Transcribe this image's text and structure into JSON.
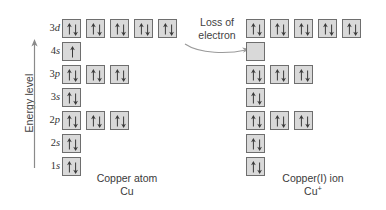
{
  "diagram": {
    "axis": {
      "label": "Energy level",
      "arrow_direction": "up"
    },
    "annotation": {
      "line1": "Loss of",
      "line2": "electron",
      "arrow": "curved-right-arrow"
    },
    "colors": {
      "box_fill": "#d9d9d9",
      "box_border": "#6e6e6e",
      "arrow": "#3a3a3a",
      "text": "#3a3a3a",
      "background": "#ffffff"
    },
    "orbital_labels": [
      {
        "n": "3",
        "l": "d"
      },
      {
        "n": "4",
        "l": "s"
      },
      {
        "n": "3",
        "l": "p"
      },
      {
        "n": "3",
        "l": "s"
      },
      {
        "n": "2",
        "l": "p"
      },
      {
        "n": "2",
        "l": "s"
      },
      {
        "n": "1",
        "l": "s"
      }
    ],
    "left": {
      "caption_line1": "Copper atom",
      "caption_line2": "Cu",
      "caption_sup": "",
      "rows": [
        {
          "label": "3d",
          "boxes": [
            "pair",
            "pair",
            "pair",
            "pair",
            "pair"
          ]
        },
        {
          "label": "4s",
          "boxes": [
            "up"
          ]
        },
        {
          "label": "3p",
          "boxes": [
            "pair",
            "pair",
            "pair"
          ]
        },
        {
          "label": "3s",
          "boxes": [
            "pair"
          ]
        },
        {
          "label": "2p",
          "boxes": [
            "pair",
            "pair",
            "pair"
          ]
        },
        {
          "label": "2s",
          "boxes": [
            "pair"
          ]
        },
        {
          "label": "1s",
          "boxes": [
            "pair"
          ]
        }
      ]
    },
    "right": {
      "caption_line1": "Copper(I) ion",
      "caption_line2": "Cu",
      "caption_sup": "+",
      "rows": [
        {
          "label": "3d",
          "boxes": [
            "pair",
            "pair",
            "pair",
            "pair",
            "pair"
          ]
        },
        {
          "label": "4s",
          "boxes": [
            "empty"
          ]
        },
        {
          "label": "3p",
          "boxes": [
            "pair",
            "pair",
            "pair"
          ]
        },
        {
          "label": "3s",
          "boxes": [
            "pair"
          ]
        },
        {
          "label": "2p",
          "boxes": [
            "pair",
            "pair",
            "pair"
          ]
        },
        {
          "label": "2s",
          "boxes": [
            "pair"
          ]
        },
        {
          "label": "1s",
          "boxes": [
            "pair"
          ]
        }
      ]
    }
  }
}
